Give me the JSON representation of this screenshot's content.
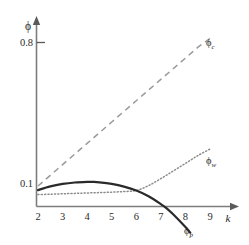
{
  "chart_data": {
    "type": "line",
    "title": "",
    "xlabel": "k",
    "ylabel": "ϕ",
    "xlim": [
      2,
      9.6
    ],
    "ylim": [
      -0.16,
      0.92
    ],
    "grid": false,
    "legend_position": "right-inline",
    "x_ticks": [
      "2",
      "3",
      "4",
      "5",
      "6",
      "7",
      "8",
      "9"
    ],
    "x_tick_values": [
      2,
      3,
      4,
      5,
      6,
      7,
      8,
      9
    ],
    "y_ticks": [
      "0.8",
      "0.1"
    ],
    "y_tick_values": [
      0.8,
      0.1
    ],
    "series": [
      {
        "name": "ϕ",
        "subscript": "c",
        "label_full": "ϕc",
        "style": "dashed",
        "color": "#9a9a9a",
        "x": [
          2.0,
          2.5,
          3.0,
          3.5,
          4.0,
          4.5,
          5.0,
          5.5,
          6.0,
          6.5,
          7.0,
          7.5,
          8.0,
          8.5,
          9.0
        ],
        "values": [
          0.1,
          0.152,
          0.204,
          0.256,
          0.308,
          0.36,
          0.412,
          0.464,
          0.516,
          0.568,
          0.62,
          0.672,
          0.724,
          0.776,
          0.82
        ]
      },
      {
        "name": "ϕ",
        "subscript": "w",
        "label_full": "ϕw",
        "style": "dotted",
        "color": "#8c8c8c",
        "x": [
          2.0,
          2.5,
          3.0,
          3.5,
          4.0,
          4.5,
          5.0,
          5.5,
          6.0,
          6.5,
          7.0,
          7.5,
          8.0,
          8.5,
          9.0
        ],
        "values": [
          0.058,
          0.06,
          0.062,
          0.064,
          0.066,
          0.068,
          0.07,
          0.073,
          0.078,
          0.102,
          0.136,
          0.173,
          0.21,
          0.248,
          0.28
        ]
      },
      {
        "name": "ϕ",
        "subscript": "p",
        "label_full": "ϕp",
        "style": "solid",
        "color": "#2a2a2a",
        "x": [
          2.0,
          2.5,
          3.0,
          3.5,
          4.0,
          4.25,
          4.5,
          5.0,
          5.5,
          6.0,
          6.5,
          7.0,
          7.25,
          7.5,
          8.0,
          8.2
        ],
        "values": [
          0.08,
          0.098,
          0.11,
          0.117,
          0.12,
          0.12,
          0.118,
          0.11,
          0.097,
          0.078,
          0.05,
          0.012,
          -0.01,
          -0.038,
          -0.1,
          -0.128
        ]
      }
    ]
  },
  "labels": {
    "y_axis_symbol": "ϕ",
    "x_axis_symbol": "k",
    "y_tick_high": "0.8",
    "y_tick_low": "0.1",
    "x_tick_2": "2",
    "x_tick_3": "3",
    "x_tick_4": "4",
    "x_tick_5": "5",
    "x_tick_6": "6",
    "x_tick_7": "7",
    "x_tick_8": "8",
    "x_tick_9": "9",
    "series_c_base": "ϕ",
    "series_c_sub": "c",
    "series_w_base": "ϕ",
    "series_w_sub": "w",
    "series_p_base": "ϕ",
    "series_p_sub": "p"
  },
  "colors": {
    "axis": "#7d7d7d",
    "text": "#2b2b2b",
    "curve_c": "#9a9a9a",
    "curve_w": "#8c8c8c",
    "curve_p": "#2a2a2a",
    "background": "#ffffff"
  }
}
